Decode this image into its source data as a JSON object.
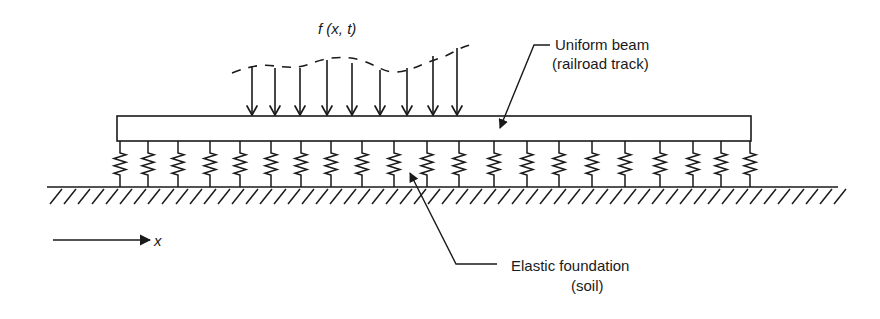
{
  "diagram": {
    "load_label": "f (x, t)",
    "beam_label_line1": "Uniform beam",
    "beam_label_line2": "(railroad track)",
    "foundation_label_line1": "Elastic foundation",
    "foundation_label_line2": "(soil)",
    "axis_label": "x",
    "stroke_color": "#1a1a1a",
    "beam": {
      "x1": 117,
      "x2": 751,
      "y_top": 116,
      "y_bottom": 141
    },
    "ground": {
      "x1": 47,
      "x2": 838,
      "y": 187
    },
    "spring_x": [
      120,
      148,
      178,
      210,
      240,
      271,
      301,
      331,
      362,
      394,
      427,
      459,
      494,
      527,
      559,
      592,
      625,
      660,
      693,
      721,
      750
    ],
    "load_arrows": [
      {
        "x": 252,
        "top": 66
      },
      {
        "x": 275,
        "top": 68
      },
      {
        "x": 300,
        "top": 68
      },
      {
        "x": 327,
        "top": 60
      },
      {
        "x": 352,
        "top": 63
      },
      {
        "x": 380,
        "top": 70
      },
      {
        "x": 407,
        "top": 68
      },
      {
        "x": 433,
        "top": 56
      },
      {
        "x": 457,
        "top": 48
      }
    ]
  }
}
